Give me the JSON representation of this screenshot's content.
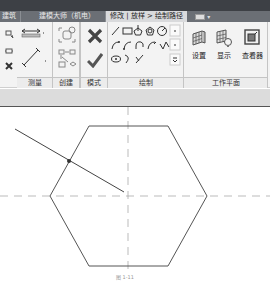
{
  "tabs": [
    {
      "label": "建筑"
    },
    {
      "label": "建模大师（机电）"
    },
    {
      "label": "修改 | 放样 > 绘制路径",
      "active": true
    }
  ],
  "tab_extra": {
    "icon": "window-switch-icon",
    "arrow": "▾"
  },
  "ribbon": {
    "panels": [
      {
        "name": "measure",
        "label": "测量"
      },
      {
        "name": "create",
        "label": "创建"
      },
      {
        "name": "mode",
        "label": "模式"
      },
      {
        "name": "draw",
        "label": "绘制"
      },
      {
        "name": "workplane",
        "label": "工作平面"
      }
    ],
    "workplane_buttons": [
      {
        "label": "设置",
        "icon": "workplane-set-icon"
      },
      {
        "label": "显示",
        "icon": "workplane-show-icon"
      },
      {
        "label": "查看器",
        "icon": "workplane-viewer-icon"
      }
    ],
    "mode_buttons": [
      {
        "name": "cancel",
        "icon": "close-icon"
      },
      {
        "name": "finish",
        "icon": "checkmark-icon"
      }
    ],
    "draw_tools": [
      "line-icon",
      "rectangle-icon",
      "inscribed-polygon-icon",
      "circumscribed-polygon-icon",
      "circle-icon",
      "start-end-arc-icon",
      "center-ends-arc-icon",
      "tangent-arc-icon",
      "fillet-arc-icon",
      "spline-icon",
      "ellipse-icon",
      "partial-ellipse-icon",
      "pick-lines-icon"
    ]
  },
  "drawing": {
    "hexagon_points": "89,19 168,19 207,89 168,159 89,159 50,89",
    "center": {
      "x": 128,
      "y": 89
    },
    "path_line": {
      "x1": 15,
      "y1": 22,
      "x2": 124,
      "y2": 85
    },
    "path_point": {
      "x": 69,
      "y": 54
    },
    "stroke_color": "#555555",
    "dash_color": "#aaaaaa"
  },
  "caption": "图 1-11"
}
